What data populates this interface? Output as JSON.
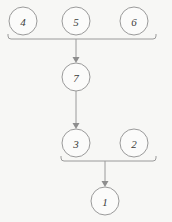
{
  "diagram": {
    "background_color": "#f7f7f5",
    "node_stroke_color": "#9a9a9a",
    "node_fill_color": "#fbfbfa",
    "edge_color": "#9a9a9a",
    "label_color": "#3b3b3b",
    "node_radius": 14,
    "nodes": [
      {
        "id": "n4",
        "label": "4",
        "cx": 23,
        "cy": 21
      },
      {
        "id": "n5",
        "label": "5",
        "cx": 76,
        "cy": 21
      },
      {
        "id": "n6",
        "label": "6",
        "cx": 134,
        "cy": 21
      },
      {
        "id": "n7",
        "label": "7",
        "cx": 76,
        "cy": 77
      },
      {
        "id": "n3",
        "label": "3",
        "cx": 76,
        "cy": 143
      },
      {
        "id": "n2",
        "label": "2",
        "cx": 134,
        "cy": 143
      },
      {
        "id": "n1",
        "label": "1",
        "cx": 105,
        "cy": 201
      }
    ],
    "brackets": [
      {
        "id": "bracket-top",
        "label": "bracket joining 4, 5, 6",
        "bar_y": 39,
        "x_start": 8,
        "x_end": 156,
        "stub_height": 5,
        "members": [
          "4",
          "5",
          "6"
        ]
      },
      {
        "id": "bracket-bottom",
        "label": "bracket joining 3, 2",
        "bar_y": 161,
        "x_start": 61,
        "x_end": 156,
        "stub_height": 5,
        "members": [
          "3",
          "2"
        ]
      }
    ],
    "edges": [
      {
        "id": "e-bracket-top-to-7",
        "from": "bracket-top",
        "to": "7",
        "x": 76,
        "y_start": 39,
        "y_end": 62
      },
      {
        "id": "e-7-to-3",
        "from": "7",
        "to": "3",
        "x": 76,
        "y_start": 91,
        "y_end": 128
      },
      {
        "id": "e-bracket-bottom-to-1",
        "from": "bracket-bottom",
        "to": "1",
        "x": 105,
        "y_start": 161,
        "y_end": 186
      }
    ]
  }
}
